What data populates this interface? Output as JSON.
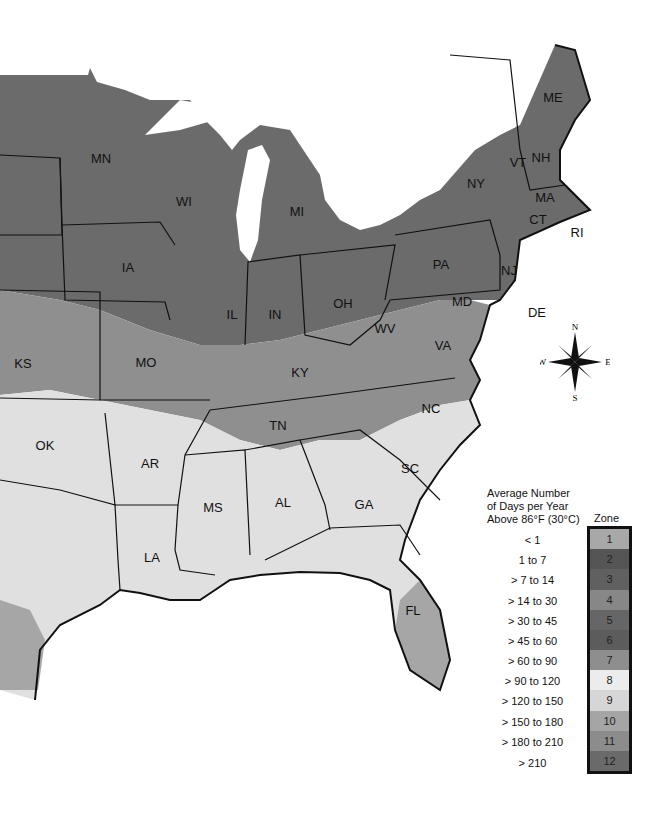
{
  "map": {
    "title": "Average Number of Days per Year Above 86°F (30°C)",
    "state_labels": [
      {
        "abbr": "ME",
        "x": 553,
        "y": 97
      },
      {
        "abbr": "VT",
        "x": 518,
        "y": 162
      },
      {
        "abbr": "NH",
        "x": 541,
        "y": 157
      },
      {
        "abbr": "NY",
        "x": 476,
        "y": 183
      },
      {
        "abbr": "MA",
        "x": 545,
        "y": 197
      },
      {
        "abbr": "CT",
        "x": 538,
        "y": 219
      },
      {
        "abbr": "RI",
        "x": 577,
        "y": 232
      },
      {
        "abbr": "PA",
        "x": 441,
        "y": 264
      },
      {
        "abbr": "NJ",
        "x": 509,
        "y": 270
      },
      {
        "abbr": "MD",
        "x": 462,
        "y": 301
      },
      {
        "abbr": "DE",
        "x": 537,
        "y": 312
      },
      {
        "abbr": "MN",
        "x": 101,
        "y": 158
      },
      {
        "abbr": "WI",
        "x": 184,
        "y": 201
      },
      {
        "abbr": "MI",
        "x": 297,
        "y": 211
      },
      {
        "abbr": "IA",
        "x": 128,
        "y": 267
      },
      {
        "abbr": "IL",
        "x": 232,
        "y": 314
      },
      {
        "abbr": "IN",
        "x": 275,
        "y": 314
      },
      {
        "abbr": "OH",
        "x": 343,
        "y": 303
      },
      {
        "abbr": "WV",
        "x": 385,
        "y": 328
      },
      {
        "abbr": "VA",
        "x": 443,
        "y": 345
      },
      {
        "abbr": "KY",
        "x": 300,
        "y": 372
      },
      {
        "abbr": "KS",
        "x": 23,
        "y": 363
      },
      {
        "abbr": "MO",
        "x": 146,
        "y": 362
      },
      {
        "abbr": "NC",
        "x": 431,
        "y": 408
      },
      {
        "abbr": "TN",
        "x": 278,
        "y": 425
      },
      {
        "abbr": "OK",
        "x": 45,
        "y": 445
      },
      {
        "abbr": "AR",
        "x": 150,
        "y": 463
      },
      {
        "abbr": "SC",
        "x": 410,
        "y": 468
      },
      {
        "abbr": "MS",
        "x": 213,
        "y": 507
      },
      {
        "abbr": "AL",
        "x": 283,
        "y": 502
      },
      {
        "abbr": "GA",
        "x": 364,
        "y": 504
      },
      {
        "abbr": "LA",
        "x": 152,
        "y": 557
      },
      {
        "abbr": "FL",
        "x": 413,
        "y": 610
      }
    ]
  },
  "compass": {
    "n": "N",
    "s": "S",
    "e": "E",
    "w": "W"
  },
  "legend": {
    "title_lines": [
      "Average Number",
      "of Days per Year",
      "Above 86°F (30°C)"
    ],
    "zone_header": "Zone",
    "zones": [
      {
        "zone": "1",
        "range": "< 1",
        "color": "#a8a8a8"
      },
      {
        "zone": "2",
        "range": "1 to 7",
        "color": "#555555"
      },
      {
        "zone": "3",
        "range": "> 7 to 14",
        "color": "#606060"
      },
      {
        "zone": "4",
        "range": "> 14 to 30",
        "color": "#878787"
      },
      {
        "zone": "5",
        "range": "> 30 to 45",
        "color": "#666666"
      },
      {
        "zone": "6",
        "range": "> 45 to 60",
        "color": "#5c5c5c"
      },
      {
        "zone": "7",
        "range": "> 60 to 90",
        "color": "#8e8e8e"
      },
      {
        "zone": "8",
        "range": "> 90 to 120",
        "color": "#ececec"
      },
      {
        "zone": "9",
        "range": "> 120 to 150",
        "color": "#d6d6d6"
      },
      {
        "zone": "10",
        "range": "> 150 to 180",
        "color": "#a5a5a5"
      },
      {
        "zone": "11",
        "range": "> 180 to 210",
        "color": "#8c8c8c"
      },
      {
        "zone": "12",
        "range": "> 210",
        "color": "#6a6a6a"
      }
    ]
  }
}
